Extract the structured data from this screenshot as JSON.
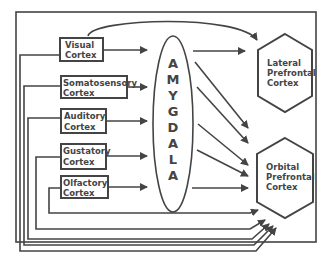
{
  "diagram": {
    "inputs": [
      {
        "line1": "Visual",
        "line2": "Cortex"
      },
      {
        "line1": "Somatosensory",
        "line2": "Cortex"
      },
      {
        "line1": "Auditory",
        "line2": "Cortex"
      },
      {
        "line1": "Gustatory",
        "line2": "Cortex"
      },
      {
        "line1": "Olfactory",
        "line2": "Cortex"
      }
    ],
    "amygdala_letters": [
      "A",
      "M",
      "Y",
      "G",
      "D",
      "A",
      "L",
      "A"
    ],
    "lateral": {
      "line1": "Lateral",
      "line2": "Prefrontal",
      "line3": "Cortex"
    },
    "orbital": {
      "line1": "Orbital",
      "line2": "Prefrontal",
      "line3": "Cortex"
    },
    "colors": {
      "stroke": "#444444",
      "background": "#ffffff"
    }
  }
}
